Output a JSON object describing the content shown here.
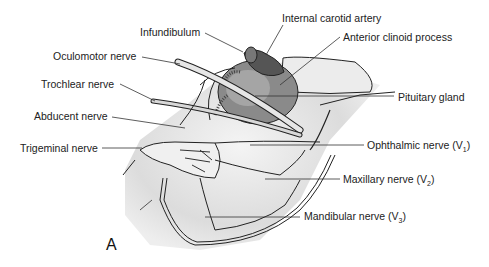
{
  "figure": {
    "panel_letter": "A",
    "labels": {
      "infundibulum": "Infundibulum",
      "internal_carotid_artery": "Internal carotid artery",
      "anterior_clinoid_process": "Anterior clinoid process",
      "oculomotor_nerve": "Oculomotor nerve",
      "trochlear_nerve": "Trochlear nerve",
      "pituitary_gland": "Pituitary gland",
      "abducent_nerve": "Abducent nerve",
      "trigeminal_nerve": "Trigeminal nerve",
      "ophthalmic_nerve": "Ophthalmic nerve (V",
      "ophthalmic_sub": "1",
      "maxillary_nerve": "Maxillary nerve (V",
      "maxillary_sub": "2",
      "mandibular_nerve": "Mandibular nerve (V",
      "mandibular_sub": "3",
      "close_paren": ")"
    }
  }
}
